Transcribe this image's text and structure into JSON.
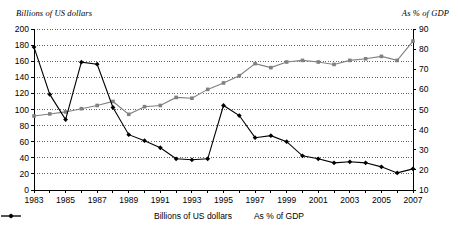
{
  "chart_data": {
    "type": "line",
    "title": "",
    "xlabel": "",
    "ylabel": "Billions of US dollars",
    "y2label": "As % of GDP",
    "grid": true,
    "legend_position": "bottom",
    "x": [
      1983,
      1984,
      1985,
      1986,
      1987,
      1988,
      1989,
      1990,
      1991,
      1992,
      1993,
      1994,
      1995,
      1996,
      1997,
      1998,
      1999,
      2000,
      2001,
      2002,
      2003,
      2004,
      2005,
      2006,
      2007
    ],
    "xtick_labels": [
      "1983",
      "",
      "1985",
      "",
      "1987",
      "",
      "1989",
      "",
      "1991",
      "",
      "1993",
      "",
      "1995",
      "",
      "1997",
      "",
      "1999",
      "",
      "2001",
      "",
      "2003",
      "",
      "2005",
      "",
      "2007"
    ],
    "ylim": [
      0,
      200
    ],
    "yticks": [
      0,
      20,
      40,
      60,
      80,
      100,
      120,
      140,
      160,
      180,
      200
    ],
    "y2lim": [
      10,
      90
    ],
    "y2ticks": [
      10,
      20,
      30,
      40,
      50,
      60,
      70,
      80,
      90
    ],
    "series": [
      {
        "name": "Billions of US dollars",
        "axis": "left",
        "color": "#808080",
        "marker": "square",
        "values": [
          92,
          94.5,
          97,
          101,
          105,
          110,
          94,
          103.5,
          105,
          115,
          114,
          125,
          133,
          142,
          157,
          152,
          159,
          161,
          159,
          156,
          161,
          163,
          166,
          161,
          185
        ]
      },
      {
        "name": "As % of GDP",
        "axis": "right",
        "color": "#000000",
        "marker": "diamond",
        "values": [
          81,
          57.5,
          45,
          73.5,
          72.5,
          51,
          37.5,
          34.5,
          31,
          25.5,
          25,
          25.5,
          52,
          47,
          36,
          37,
          34,
          27,
          25.5,
          23.5,
          24,
          23.5,
          21.5,
          18.5,
          20.5
        ]
      }
    ]
  },
  "legend": {
    "items": [
      {
        "label": "Billions of US dollars",
        "color": "#808080",
        "marker": "square"
      },
      {
        "label": "As % of GDP",
        "color": "#000000",
        "marker": "diamond"
      }
    ]
  }
}
